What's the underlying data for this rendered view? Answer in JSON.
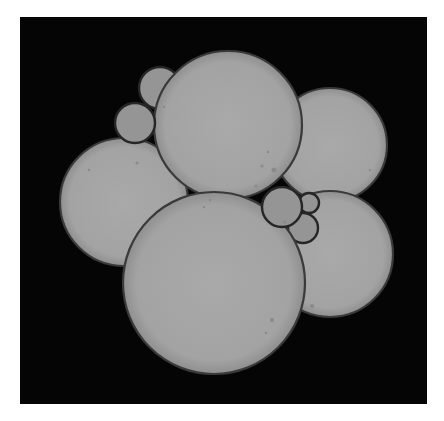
{
  "image": {
    "description": "Grayscale micrograph of a cluster of overlapping spherical cells on a black background",
    "colors": {
      "page_background": "#ffffff",
      "frame_background": "#050505",
      "cell_fill": "#a6a6a6",
      "cell_fill_shadow": "#959595",
      "cell_outline": "#3a3a3a",
      "small_cell_outline": "#262626",
      "speck": "#8a8a8a"
    },
    "frame": {
      "x": 20,
      "y": 17,
      "width": 407,
      "height": 387
    },
    "cells": [
      {
        "id": "small-top-back",
        "cx": 160,
        "cy": 88,
        "r": 21,
        "kind": "small"
      },
      {
        "id": "right-top",
        "cx": 330,
        "cy": 145,
        "r": 57,
        "kind": "large"
      },
      {
        "id": "right-bottom",
        "cx": 330,
        "cy": 254,
        "r": 63,
        "kind": "large"
      },
      {
        "id": "left",
        "cx": 124,
        "cy": 202,
        "r": 64,
        "kind": "large"
      },
      {
        "id": "top-center",
        "cx": 228,
        "cy": 125,
        "r": 74,
        "kind": "large"
      },
      {
        "id": "small-right-lower",
        "cx": 303,
        "cy": 228,
        "r": 15,
        "kind": "small"
      },
      {
        "id": "bottom-center",
        "cx": 214,
        "cy": 283,
        "r": 91,
        "kind": "large"
      },
      {
        "id": "small-top-front",
        "cx": 135,
        "cy": 123,
        "r": 20,
        "kind": "small"
      },
      {
        "id": "small-right-tiny",
        "cx": 309,
        "cy": 203,
        "r": 10,
        "kind": "small"
      },
      {
        "id": "small-right-main",
        "cx": 282,
        "cy": 207,
        "r": 20,
        "kind": "small"
      }
    ],
    "specks": [
      {
        "cx": 274,
        "cy": 170,
        "r": 2.5
      },
      {
        "cx": 262,
        "cy": 166,
        "r": 1.5
      },
      {
        "cx": 268,
        "cy": 152,
        "r": 1.2
      },
      {
        "cx": 256,
        "cy": 186,
        "r": 1.5
      },
      {
        "cx": 210,
        "cy": 200,
        "r": 1.3
      },
      {
        "cx": 204,
        "cy": 207,
        "r": 1.2
      },
      {
        "cx": 272,
        "cy": 320,
        "r": 2
      },
      {
        "cx": 266,
        "cy": 333,
        "r": 1.2
      },
      {
        "cx": 312,
        "cy": 306,
        "r": 2
      },
      {
        "cx": 89,
        "cy": 170,
        "r": 1.3
      },
      {
        "cx": 137,
        "cy": 163,
        "r": 1.5
      },
      {
        "cx": 164,
        "cy": 107,
        "r": 1.2
      },
      {
        "cx": 285,
        "cy": 222,
        "r": 1.5
      },
      {
        "cx": 370,
        "cy": 170,
        "r": 1.2
      }
    ]
  }
}
